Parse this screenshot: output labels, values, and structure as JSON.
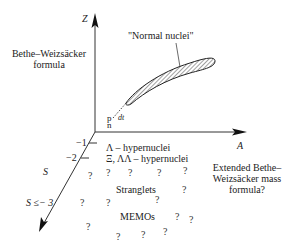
{
  "axes": {
    "z_label": "Z",
    "a_label": "A",
    "s_tick_1": "−1",
    "s_tick_2": "−2",
    "s_label": "S",
    "s_le3_label": "S ≤− 3"
  },
  "labels": {
    "bethe_weizsacker_line1": "Bethe–Weizsäcker",
    "bethe_weizsacker_line2": "formula",
    "normal_nuclei": "\"Normal nuclei\"",
    "p": "p",
    "n": "n",
    "dt": "dt",
    "lambda_hypernuclei": "Λ – hypernuclei",
    "xi_hypernuclei": "Ξ, ΛΛ – hypernuclei",
    "strangelets": "Stranglets",
    "memos": "MEMOs",
    "extended_line1": "Extended Bethe–",
    "extended_line2": "Weizsäcker mass",
    "extended_line3": "formula?"
  },
  "question_mark": "?",
  "colors": {
    "axis": "#333333",
    "text": "#222222",
    "hatch": "#444444"
  }
}
